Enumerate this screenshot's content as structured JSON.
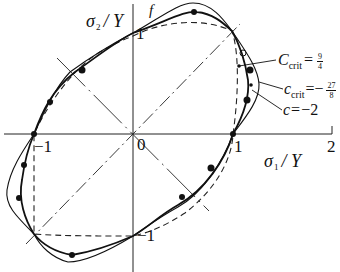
{
  "figure": {
    "type": "yield-locus-diagram",
    "x_axis": {
      "symbol": "σ",
      "subscript": "1",
      "unit": "Y",
      "label": "σ1 / Y",
      "ticks": [
        "-1",
        "0",
        "1",
        "2"
      ]
    },
    "y_axis": {
      "symbol": "σ",
      "subscript": "2",
      "unit": "Y",
      "label": "σ2 / Y",
      "ticks": [
        "1",
        "-1"
      ]
    },
    "origin_label": "0",
    "top_label": "f",
    "curves": [
      {
        "id": "c-crit-upper",
        "prefix": "C",
        "sub": "crit",
        "eq": "=",
        "frac_num": "9",
        "frac_den": "4",
        "sign": "",
        "style": "thick-solid"
      },
      {
        "id": "c-crit-lower",
        "prefix": "c",
        "sub": "crit",
        "eq": "=−",
        "frac_num": "27",
        "frac_den": "8",
        "sign": "-",
        "style": "thin-solid"
      },
      {
        "id": "c-minus-2",
        "prefix": "c",
        "sub": "",
        "eq": "=",
        "value": "−2",
        "style": "dashed"
      }
    ],
    "tick_labels": {
      "x_neg1": "−1",
      "x_0": "0",
      "x_1": "1",
      "x_2": "2",
      "y_1": "1",
      "y_neg1": "−1"
    },
    "colors": {
      "ink": "#111111",
      "background": "#ffffff"
    }
  }
}
